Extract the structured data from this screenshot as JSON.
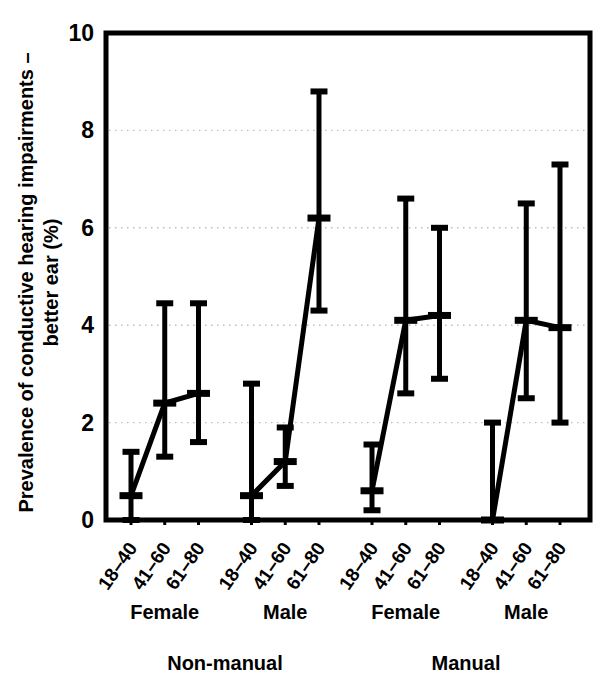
{
  "chart_data": {
    "type": "scatter",
    "title": "",
    "subtitle": "",
    "xlabel": "",
    "ylabel": "Prevalence of conductive hearing impairments – better ear (%)",
    "ylabel_line1": "Prevalence of conductive hearing impairments –",
    "ylabel_line2": "better ear (%)",
    "ylim": [
      0,
      10
    ],
    "ytick_labels": [
      "0",
      "2",
      "4",
      "6",
      "8",
      "10"
    ],
    "ytick_values": [
      0,
      2,
      4,
      6,
      8,
      10
    ],
    "grid": "horizontal-dotted",
    "legend": "none",
    "error_bars": "95% confidence interval",
    "connector_lines": true,
    "categories": [
      "18–40",
      "41–60",
      "61–80"
    ],
    "tick_labels": [
      "18–40",
      "41–60",
      "61–80",
      "18–40",
      "41–60",
      "61–80",
      "18–40",
      "41–60",
      "61–80",
      "18–40",
      "41–60",
      "61–80"
    ],
    "group_labels": [
      "Female",
      "Male",
      "Female",
      "Male"
    ],
    "supergroup_labels": [
      "Non-manual",
      "Manual"
    ],
    "series": [
      {
        "name": "Non-manual Female",
        "supergroup": "Non-manual",
        "sex": "Female",
        "x": [
          "18–40",
          "41–60",
          "61–80"
        ],
        "values": [
          0.5,
          2.4,
          2.6
        ],
        "lower": [
          0.0,
          1.3,
          1.6
        ],
        "upper": [
          1.4,
          4.45,
          4.45
        ]
      },
      {
        "name": "Non-manual Male",
        "supergroup": "Non-manual",
        "sex": "Male",
        "x": [
          "18–40",
          "41–60",
          "61–80"
        ],
        "values": [
          0.5,
          1.2,
          6.2
        ],
        "lower": [
          0.0,
          0.7,
          4.3
        ],
        "upper": [
          2.8,
          1.9,
          8.8
        ]
      },
      {
        "name": "Manual Female",
        "supergroup": "Manual",
        "sex": "Female",
        "x": [
          "18–40",
          "41–60",
          "61–80"
        ],
        "values": [
          0.6,
          4.1,
          4.2
        ],
        "lower": [
          0.2,
          2.6,
          2.9
        ],
        "upper": [
          1.55,
          6.6,
          6.0
        ]
      },
      {
        "name": "Manual Male",
        "supergroup": "Manual",
        "sex": "Male",
        "x": [
          "18–40",
          "41–60",
          "61–80"
        ],
        "values": [
          0.0,
          4.1,
          3.95
        ],
        "lower": [
          0.0,
          2.5,
          2.0
        ],
        "upper": [
          2.0,
          6.5,
          7.3
        ]
      }
    ],
    "colors": {
      "ink": "#000000",
      "background": "#ffffff",
      "grid": "#bdbdbd"
    }
  }
}
